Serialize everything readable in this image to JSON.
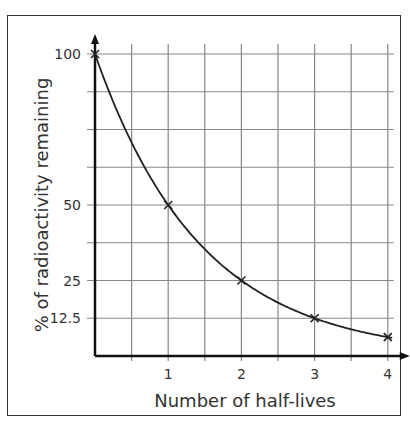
{
  "chart_data": {
    "type": "line",
    "title": "",
    "xlabel": "Number of half-lives",
    "ylabel": "% of radioactivity remaining",
    "x": [
      0,
      1,
      2,
      3,
      4
    ],
    "series": [
      {
        "name": "radioactivity remaining",
        "values": [
          100,
          50,
          25,
          12.5,
          6.25
        ],
        "marker": "x",
        "smooth": true
      }
    ],
    "xticks": [
      "1",
      "2",
      "3",
      "4"
    ],
    "xtick_values": [
      1,
      2,
      3,
      4
    ],
    "yticks": [
      "100",
      "50",
      "25",
      "12.5"
    ],
    "ytick_values": [
      100,
      50,
      25,
      12.5
    ],
    "xlim": [
      0,
      4.25
    ],
    "ylim": [
      0,
      100
    ],
    "grid": true,
    "legend": null,
    "colors": {
      "line": "#222222",
      "grid": "#888888",
      "axis": "#111111",
      "text": "#333333"
    }
  }
}
